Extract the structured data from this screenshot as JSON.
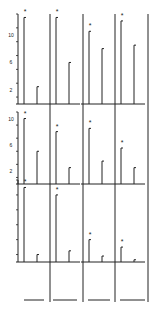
{
  "figure": {
    "ink_color": "#222222",
    "background": "#ffffff",
    "significance_marker": "*"
  },
  "chart_data": {
    "type": "bar",
    "layout": "grid 3 rows x 4 columns of small multiples, plus a 4th row of empty baseline segments",
    "title": "",
    "xlabel": "",
    "ylabel": "",
    "grid": false,
    "legend": null,
    "yaxis_ticks": {
      "row1": {
        "labels": [
          "2",
          "6",
          "10"
        ],
        "ylim": [
          0,
          13
        ]
      },
      "row2": {
        "labels": [
          "2",
          "6",
          "10"
        ],
        "ylim": [
          0,
          11
        ]
      },
      "row3": {
        "labels": [],
        "ylim": [
          0,
          11
        ]
      }
    },
    "panels": [
      {
        "row": 1,
        "col": 1,
        "values": [
          12.5,
          2.5
        ],
        "significant": [
          true,
          false
        ]
      },
      {
        "row": 1,
        "col": 2,
        "values": [
          12.5,
          6.0
        ],
        "significant": [
          true,
          false
        ]
      },
      {
        "row": 1,
        "col": 3,
        "values": [
          10.5,
          8.0
        ],
        "significant": [
          true,
          false
        ]
      },
      {
        "row": 1,
        "col": 4,
        "values": [
          12.0,
          8.5
        ],
        "significant": [
          true,
          false
        ]
      },
      {
        "row": 2,
        "col": 1,
        "values": [
          10.0,
          5.0
        ],
        "significant": [
          true,
          false
        ]
      },
      {
        "row": 2,
        "col": 2,
        "values": [
          8.0,
          2.5
        ],
        "significant": [
          true,
          false
        ]
      },
      {
        "row": 2,
        "col": 3,
        "values": [
          8.5,
          3.5
        ],
        "significant": [
          true,
          false
        ]
      },
      {
        "row": 2,
        "col": 4,
        "values": [
          5.5,
          2.5
        ],
        "significant": [
          true,
          false
        ]
      },
      {
        "row": 3,
        "col": 1,
        "values": [
          10.0,
          1.0
        ],
        "significant": [
          true,
          false
        ]
      },
      {
        "row": 3,
        "col": 2,
        "values": [
          9.0,
          1.5
        ],
        "significant": [
          true,
          false
        ]
      },
      {
        "row": 3,
        "col": 3,
        "values": [
          3.0,
          0.8
        ],
        "significant": [
          true,
          false
        ]
      },
      {
        "row": 3,
        "col": 4,
        "values": [
          2.0,
          0.3
        ],
        "significant": [
          true,
          false
        ]
      }
    ]
  }
}
